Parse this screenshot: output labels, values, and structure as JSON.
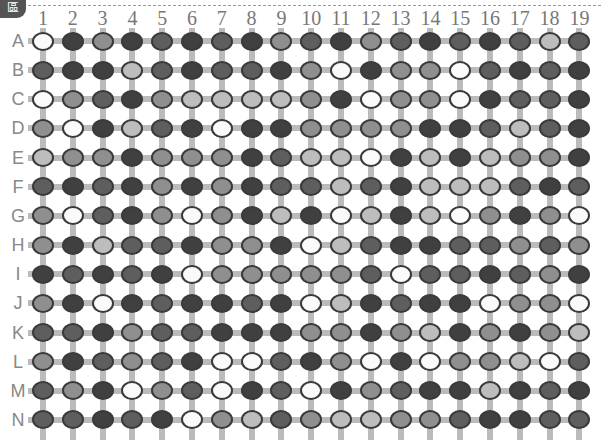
{
  "header": {
    "tab_glyph": "區"
  },
  "board": {
    "columns": [
      "1",
      "2",
      "3",
      "4",
      "5",
      "6",
      "7",
      "8",
      "9",
      "10",
      "11",
      "12",
      "13",
      "14",
      "15",
      "16",
      "17",
      "18",
      "19"
    ],
    "rows": [
      "A",
      "B",
      "C",
      "D",
      "E",
      "F",
      "G",
      "H",
      "I",
      "J",
      "K",
      "L",
      "M",
      "N"
    ],
    "shade_legend": {
      "W": "white",
      "L": "light-gray",
      "M": "medium-gray",
      "D": "dark-gray",
      "K": "very-dark-gray"
    },
    "grid": [
      [
        "W",
        "K",
        "M",
        "K",
        "D",
        "K",
        "D",
        "K",
        "M",
        "D",
        "K",
        "M",
        "D",
        "K",
        "D",
        "K",
        "D",
        "L",
        "D"
      ],
      [
        "D",
        "K",
        "K",
        "L",
        "D",
        "K",
        "D",
        "D",
        "K",
        "M",
        "W",
        "K",
        "M",
        "M",
        "W",
        "D",
        "K",
        "D",
        "K"
      ],
      [
        "W",
        "M",
        "D",
        "K",
        "M",
        "L",
        "L",
        "L",
        "L",
        "M",
        "K",
        "W",
        "M",
        "M",
        "W",
        "K",
        "D",
        "D",
        "K"
      ],
      [
        "M",
        "W",
        "K",
        "L",
        "D",
        "K",
        "W",
        "K",
        "K",
        "M",
        "M",
        "M",
        "M",
        "K",
        "K",
        "D",
        "L",
        "D",
        "K"
      ],
      [
        "L",
        "M",
        "M",
        "K",
        "M",
        "M",
        "M",
        "K",
        "D",
        "L",
        "L",
        "W",
        "K",
        "L",
        "K",
        "L",
        "M",
        "M",
        "K"
      ],
      [
        "D",
        "K",
        "D",
        "K",
        "M",
        "K",
        "M",
        "K",
        "D",
        "D",
        "L",
        "D",
        "K",
        "L",
        "L",
        "L",
        "D",
        "K",
        "D"
      ],
      [
        "M",
        "W",
        "D",
        "K",
        "M",
        "W",
        "M",
        "K",
        "L",
        "K",
        "W",
        "L",
        "K",
        "L",
        "W",
        "M",
        "K",
        "M",
        "W"
      ],
      [
        "M",
        "K",
        "L",
        "D",
        "D",
        "K",
        "M",
        "M",
        "K",
        "W",
        "L",
        "D",
        "K",
        "K",
        "D",
        "D",
        "M",
        "D",
        "M"
      ],
      [
        "K",
        "D",
        "K",
        "D",
        "K",
        "W",
        "M",
        "M",
        "M",
        "M",
        "M",
        "D",
        "W",
        "D",
        "D",
        "K",
        "D",
        "M",
        "K"
      ],
      [
        "M",
        "K",
        "W",
        "K",
        "D",
        "K",
        "K",
        "D",
        "K",
        "W",
        "L",
        "K",
        "D",
        "K",
        "K",
        "W",
        "M",
        "M",
        "W"
      ],
      [
        "D",
        "D",
        "K",
        "M",
        "D",
        "D",
        "K",
        "K",
        "K",
        "M",
        "M",
        "K",
        "M",
        "L",
        "K",
        "M",
        "K",
        "M",
        "L"
      ],
      [
        "M",
        "K",
        "D",
        "M",
        "D",
        "K",
        "W",
        "W",
        "D",
        "K",
        "M",
        "W",
        "K",
        "W",
        "M",
        "M",
        "L",
        "W",
        "D"
      ],
      [
        "D",
        "M",
        "K",
        "W",
        "M",
        "D",
        "W",
        "K",
        "D",
        "W",
        "K",
        "M",
        "D",
        "K",
        "K",
        "L",
        "K",
        "D",
        "K"
      ],
      [
        "D",
        "D",
        "K",
        "D",
        "K",
        "W",
        "M",
        "L",
        "D",
        "M",
        "L",
        "L",
        "M",
        "M",
        "D",
        "K",
        "K",
        "D",
        "D"
      ]
    ]
  },
  "layout": {
    "x0": 43,
    "dx": 29.8,
    "y0": 41,
    "dy": 29.15
  }
}
